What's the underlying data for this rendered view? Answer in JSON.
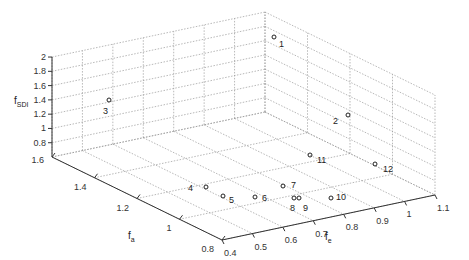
{
  "chart_data": {
    "type": "scatter3d",
    "title": "",
    "xlabel": "f_a",
    "ylabel": "f_e",
    "zlabel": "f_SDI",
    "axes": {
      "fa": {
        "label": "f",
        "sub": "a",
        "range": [
          0.8,
          1.6
        ],
        "ticks": [
          0.8,
          1,
          1.2,
          1.4,
          1.6
        ],
        "tick_labels": [
          "0.8",
          "1",
          "1.2",
          "1.4",
          "1.6"
        ]
      },
      "fe": {
        "label": "f",
        "sub": "e",
        "range": [
          0.4,
          1.1
        ],
        "ticks": [
          0.4,
          0.5,
          0.6,
          0.7,
          0.8,
          0.9,
          1.0,
          1.1
        ],
        "tick_labels": [
          "0.4",
          "0.5",
          "0.6",
          "0.7",
          "0.8",
          "0.9",
          "1",
          "1.1"
        ]
      },
      "fsdi": {
        "label": "f",
        "sub": "SDI",
        "range": [
          0.6,
          2.0
        ],
        "ticks": [
          0.8,
          1.0,
          1.2,
          1.4,
          1.6,
          1.8,
          2.0
        ],
        "tick_labels": [
          "0.8",
          "1",
          "1.2",
          "1.4",
          "1.6",
          "1.8",
          "2"
        ]
      }
    },
    "grid": true,
    "points": [
      {
        "id": "1",
        "fa": 1.55,
        "fe": 1.05,
        "fsdi": 1.9
      },
      {
        "id": "2",
        "fa": 1.0,
        "fe": 1.05,
        "fsdi": 1.55
      },
      {
        "id": "3",
        "fa": 1.5,
        "fe": 0.5,
        "fsdi": 1.55
      },
      {
        "id": "4",
        "fa": 1.05,
        "fe": 0.55,
        "fsdi": 0.6
      },
      {
        "id": "5",
        "fa": 0.95,
        "fe": 0.58,
        "fsdi": 0.6
      },
      {
        "id": "6",
        "fa": 0.95,
        "fe": 0.68,
        "fsdi": 0.6
      },
      {
        "id": "7",
        "fa": 1.05,
        "fe": 0.78,
        "fsdi": 0.6
      },
      {
        "id": "8",
        "fa": 0.95,
        "fe": 0.78,
        "fsdi": 0.6
      },
      {
        "id": "9",
        "fa": 0.95,
        "fe": 0.79,
        "fsdi": 0.6
      },
      {
        "id": "10",
        "fa": 0.9,
        "fe": 0.88,
        "fsdi": 0.6
      },
      {
        "id": "11",
        "fa": 1.25,
        "fe": 0.95,
        "fsdi": 0.6
      },
      {
        "id": "12",
        "fa": 1.05,
        "fe": 1.05,
        "fsdi": 0.6
      }
    ]
  },
  "labels": {
    "fsdi_main": "f",
    "fsdi_sub": "SDI",
    "fa_main": "f",
    "fa_sub": "a",
    "fe_main": "f",
    "fe_sub": "e"
  }
}
